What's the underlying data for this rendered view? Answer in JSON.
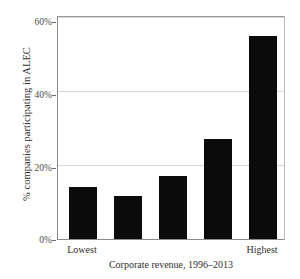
{
  "chart_data": {
    "type": "bar",
    "title": "",
    "subtitle": "",
    "xlabel": "Corporate revenue, 1996–2013",
    "ylabel": "% companies participating in ALEC",
    "categories": [
      "Lowest",
      "",
      "",
      "",
      "Highest"
    ],
    "values": [
      14,
      11.5,
      17,
      27,
      55
    ],
    "ylim": [
      0,
      60
    ],
    "yticks": [
      0,
      20,
      40,
      60
    ],
    "ytick_labels": [
      "0%",
      "20%",
      "40%",
      "60%"
    ],
    "xtick_labels": [
      "Lowest",
      "Highest"
    ],
    "grid": "horizontal",
    "legend": "none",
    "bar_color": "#0b0b0b",
    "grid_color": "#d9d9d9",
    "frame_color": "#8a8a8a",
    "value_unit": "percent"
  },
  "axes": {
    "y": {
      "label": "% companies participating in ALEC",
      "ticks": [
        {
          "value": 60,
          "label": "60%"
        },
        {
          "value": 40,
          "label": "40%"
        },
        {
          "value": 20,
          "label": "20%"
        },
        {
          "value": 0,
          "label": "0%"
        }
      ]
    },
    "x": {
      "label": "Corporate revenue, 1996–2013",
      "ticks": [
        {
          "index": 0,
          "label": "Lowest"
        },
        {
          "index": 4,
          "label": "Highest"
        }
      ]
    }
  }
}
